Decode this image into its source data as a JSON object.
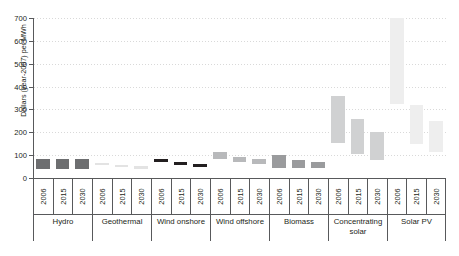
{
  "chart_data": {
    "type": "bar",
    "subtype": "floating-range-bar",
    "title": "",
    "xlabel": "",
    "ylabel": "Dollars (year-2007) per MWh",
    "ylim": [
      0,
      700
    ],
    "yticks": [
      0,
      100,
      200,
      300,
      400,
      500,
      600,
      700
    ],
    "grid": true,
    "legend": "none",
    "categories": [
      "2006",
      "2015",
      "2030"
    ],
    "groups": [
      {
        "name": "Hydro",
        "color": "#6d6e70",
        "bars": [
          {
            "year": "2006",
            "low": 40,
            "high": 85
          },
          {
            "year": "2015",
            "low": 40,
            "high": 85
          },
          {
            "year": "2030",
            "low": 40,
            "high": 85
          }
        ]
      },
      {
        "name": "Geothermal",
        "color": "#e3e3e3",
        "bars": [
          {
            "year": "2006",
            "low": 55,
            "high": 65
          },
          {
            "year": "2015",
            "low": 48,
            "high": 58
          },
          {
            "year": "2030",
            "low": 40,
            "high": 52
          }
        ]
      },
      {
        "name": "Wind onshore",
        "color": "#231f20",
        "bars": [
          {
            "year": "2006",
            "low": 68,
            "high": 82
          },
          {
            "year": "2015",
            "low": 58,
            "high": 72
          },
          {
            "year": "2030",
            "low": 50,
            "high": 62
          }
        ]
      },
      {
        "name": "Wind offshore",
        "color": "#b8b9bb",
        "bars": [
          {
            "year": "2006",
            "low": 85,
            "high": 115
          },
          {
            "year": "2015",
            "low": 68,
            "high": 90
          },
          {
            "year": "2030",
            "low": 62,
            "high": 82
          }
        ]
      },
      {
        "name": "Biomass",
        "color": "#9a9b9d",
        "bars": [
          {
            "year": "2006",
            "low": 42,
            "high": 100
          },
          {
            "year": "2015",
            "low": 42,
            "high": 78
          },
          {
            "year": "2030",
            "low": 42,
            "high": 68
          }
        ]
      },
      {
        "name": "Concentrating\nsolar",
        "color": "#d0d1d2",
        "bars": [
          {
            "year": "2006",
            "low": 155,
            "high": 360
          },
          {
            "year": "2015",
            "low": 105,
            "high": 260
          },
          {
            "year": "2030",
            "low": 78,
            "high": 200
          }
        ]
      },
      {
        "name": "Solar PV",
        "color": "#eeeeee",
        "bars": [
          {
            "year": "2006",
            "low": 325,
            "high": 700
          },
          {
            "year": "2015",
            "low": 148,
            "high": 320
          },
          {
            "year": "2030",
            "low": 112,
            "high": 248
          }
        ]
      }
    ]
  }
}
